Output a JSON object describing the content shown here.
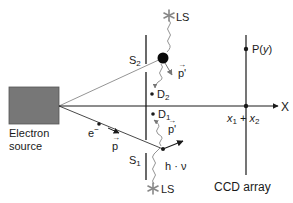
{
  "diagram": {
    "source": {
      "label_line1": "Electron",
      "label_line2": "source",
      "color": "#777777"
    },
    "screen": {
      "slit_top_label": "S",
      "slit_top_sub": "2",
      "slit_bottom_label": "S",
      "slit_bottom_sub": "1"
    },
    "light_sources": {
      "top_label": "LS",
      "bottom_label": "LS",
      "color": "#888888"
    },
    "detectors": {
      "d2_label": "D",
      "d2_sub": "2",
      "d1_label": "D",
      "d1_sub": "1"
    },
    "momentum": {
      "p_label": "p",
      "p_prime_label": "p'"
    },
    "electron": {
      "label": "e",
      "sup": "−"
    },
    "photon": {
      "label": "h · ν"
    },
    "axis": {
      "label": "X"
    },
    "ccd": {
      "label": "CCD array",
      "point_label": "P(",
      "point_var": "y",
      "point_close": ")",
      "center_x1": "x",
      "center_x1_sub": "1",
      "plus": " + ",
      "center_x2": "x",
      "center_x2_sub": "2"
    }
  }
}
